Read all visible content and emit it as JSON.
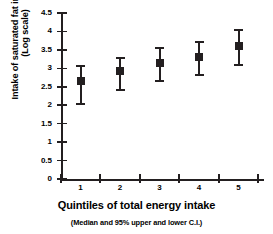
{
  "chart_data": {
    "type": "scatter",
    "title": "",
    "xlabel": "Quintiles of total energy intake",
    "xsublabel": "(Median and 95% upper and lower C.I.)",
    "ylabel_line1": "Intake of saturated fat in grams",
    "ylabel_line2": "(Log scale)",
    "categories": [
      "1",
      "2",
      "3",
      "4",
      "5"
    ],
    "xtick_labels": [
      "1",
      "2",
      "3",
      "4",
      "5"
    ],
    "ytick_labels": [
      "0",
      "0.5",
      "1",
      "1.5",
      "2",
      "2.5",
      "3",
      "3.5",
      "4",
      "4.5"
    ],
    "ytick_values": [
      0,
      0.5,
      1,
      1.5,
      2,
      2.5,
      3,
      3.5,
      4,
      4.5
    ],
    "ylim": [
      0,
      4.5
    ],
    "grid": false,
    "legend": false,
    "series": [
      {
        "name": "Median and 95% C.I.",
        "values": [
          2.65,
          2.93,
          3.14,
          3.32,
          3.6
        ],
        "lower": [
          2.03,
          2.4,
          2.65,
          2.82,
          3.08
        ],
        "upper": [
          3.05,
          3.27,
          3.55,
          3.72,
          4.05
        ]
      }
    ],
    "marker_color": "#231f20",
    "axis_color": "#231f20",
    "background_color": "#ffffff"
  }
}
